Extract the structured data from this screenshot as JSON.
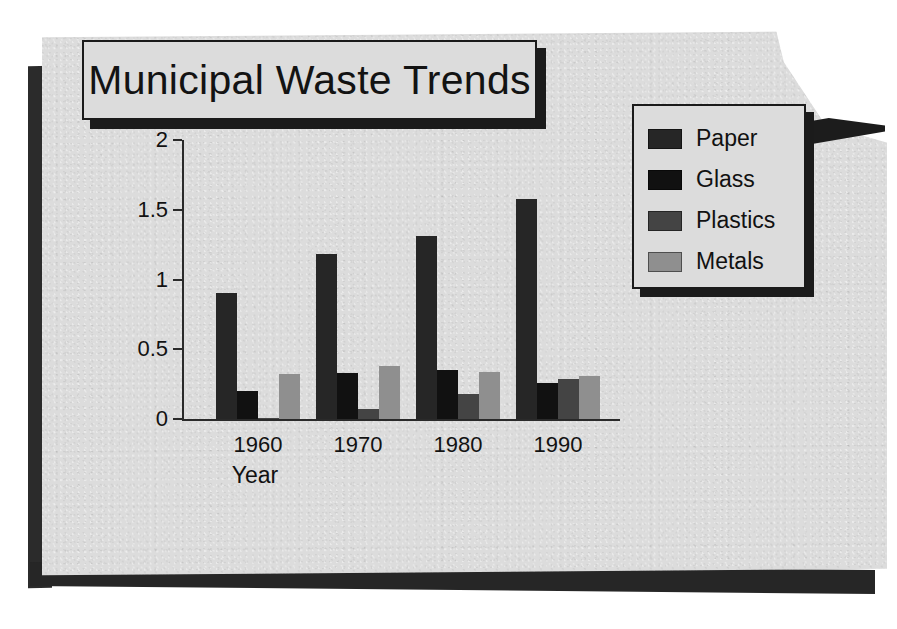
{
  "document": {
    "title": "Municipal Waste Trends"
  },
  "chart_data": {
    "type": "bar",
    "title": "Municipal Waste Trends",
    "xlabel": "Year",
    "ylabel": "Pounds per Day",
    "categories": [
      "1960",
      "1970",
      "1980",
      "1990"
    ],
    "ylim": [
      0,
      2
    ],
    "yticks": [
      "0",
      "0.5",
      "1",
      "1.5",
      "2"
    ],
    "ytick_values": [
      0,
      0.5,
      1,
      1.5,
      2
    ],
    "grid": false,
    "legend_position": "right",
    "series": [
      {
        "name": "Paper",
        "color": "#262626",
        "values": [
          0.9,
          1.18,
          1.31,
          1.58
        ]
      },
      {
        "name": "Glass",
        "color": "#111111",
        "values": [
          0.2,
          0.33,
          0.35,
          0.26
        ]
      },
      {
        "name": "Plastics",
        "color": "#444444",
        "values": [
          0.01,
          0.07,
          0.18,
          0.29
        ]
      },
      {
        "name": "Metals",
        "color": "#8f8f8f",
        "values": [
          0.32,
          0.38,
          0.34,
          0.31
        ]
      }
    ]
  },
  "colors": {
    "page": "#dcdcdc",
    "ink": "#111111",
    "shadow": "#1b1b1b"
  }
}
